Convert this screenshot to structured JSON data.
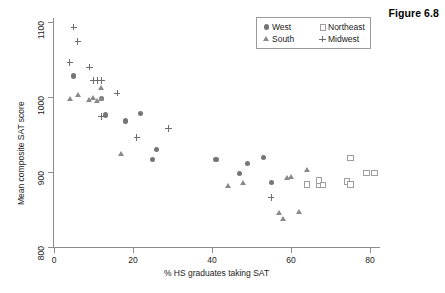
{
  "figure": {
    "title": "Figure 6.8"
  },
  "axes": {
    "x_label": "% HS graduates taking SAT",
    "y_label": "Mean composite SAT score",
    "x_ticks": [
      "0",
      "20",
      "40",
      "60",
      "80"
    ],
    "y_ticks": [
      "800",
      "900",
      "1000",
      "1100"
    ]
  },
  "legend": {
    "entries": [
      {
        "label": "West",
        "marker": "filled-circle"
      },
      {
        "label": "Northeast",
        "marker": "open-square"
      },
      {
        "label": "South",
        "marker": "filled-triangle"
      },
      {
        "label": "Midwest",
        "marker": "plus"
      }
    ]
  },
  "colors": {
    "west": "#767676",
    "northeast": "#9e9e9e",
    "south": "#8a8a8a",
    "midwest": "#6e6e6e",
    "axis": "#8c8c8c",
    "text": "#1a1a1a"
  },
  "chart_data": {
    "type": "scatter",
    "title": "Figure 6.8",
    "xlabel": "% HS graduates taking SAT",
    "ylabel": "Mean composite SAT score",
    "xlim": [
      0,
      85
    ],
    "ylim": [
      800,
      1100
    ],
    "grid": false,
    "legend_position": "top-right",
    "series": [
      {
        "name": "West",
        "marker": "filled-circle",
        "color": "#767676",
        "points": [
          [
            5,
            1028
          ],
          [
            12,
            998
          ],
          [
            13,
            976
          ],
          [
            18,
            968
          ],
          [
            22,
            978
          ],
          [
            25,
            917
          ],
          [
            26,
            930
          ],
          [
            41,
            917
          ],
          [
            47,
            898
          ],
          [
            49,
            911
          ],
          [
            53,
            919
          ],
          [
            55,
            886
          ]
        ]
      },
      {
        "name": "South",
        "marker": "filled-triangle",
        "color": "#8a8a8a",
        "points": [
          [
            4,
            998
          ],
          [
            6,
            1003
          ],
          [
            9,
            996
          ],
          [
            10,
            999
          ],
          [
            11,
            995
          ],
          [
            12,
            1012
          ],
          [
            12,
            997
          ],
          [
            17,
            924
          ],
          [
            44,
            881
          ],
          [
            48,
            886
          ],
          [
            57,
            846
          ],
          [
            58,
            838
          ],
          [
            59,
            892
          ],
          [
            60,
            893
          ],
          [
            62,
            847
          ],
          [
            64,
            903
          ]
        ]
      },
      {
        "name": "Midwest",
        "marker": "plus",
        "color": "#6e6e6e",
        "points": [
          [
            5,
            1093
          ],
          [
            6,
            1074
          ],
          [
            4,
            1046
          ],
          [
            9,
            1040
          ],
          [
            10,
            1022
          ],
          [
            11,
            1022
          ],
          [
            12,
            1022
          ],
          [
            12,
            974
          ],
          [
            16,
            1005
          ],
          [
            21,
            946
          ],
          [
            29,
            958
          ],
          [
            55,
            866
          ]
        ]
      },
      {
        "name": "Northeast",
        "marker": "open-square",
        "color": "#9e9e9e",
        "points": [
          [
            64,
            884
          ],
          [
            67,
            884
          ],
          [
            67,
            889
          ],
          [
            68,
            883
          ],
          [
            74,
            888
          ],
          [
            75,
            884
          ],
          [
            75,
            919
          ],
          [
            79,
            899
          ],
          [
            81,
            899
          ]
        ]
      }
    ]
  }
}
